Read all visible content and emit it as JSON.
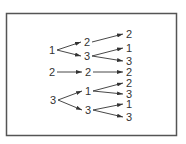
{
  "diagram": {
    "type": "tree",
    "color": "#333333",
    "nodes": [
      {
        "id": "a1",
        "label": "1",
        "x": 52,
        "y": 50
      },
      {
        "id": "a2",
        "label": "2",
        "x": 52,
        "y": 72
      },
      {
        "id": "a3",
        "label": "3",
        "x": 53,
        "y": 100
      },
      {
        "id": "b1",
        "label": "2",
        "x": 87,
        "y": 42
      },
      {
        "id": "b2",
        "label": "3",
        "x": 87,
        "y": 56
      },
      {
        "id": "b3",
        "label": "2",
        "x": 88,
        "y": 72
      },
      {
        "id": "b4",
        "label": "1",
        "x": 88,
        "y": 91
      },
      {
        "id": "b5",
        "label": "3",
        "x": 88,
        "y": 110
      },
      {
        "id": "c1",
        "label": "2",
        "x": 129,
        "y": 34
      },
      {
        "id": "c2",
        "label": "1",
        "x": 129,
        "y": 48
      },
      {
        "id": "c3",
        "label": "3",
        "x": 129,
        "y": 61
      },
      {
        "id": "c4",
        "label": "2",
        "x": 129,
        "y": 72
      },
      {
        "id": "c5",
        "label": "2",
        "x": 129,
        "y": 83
      },
      {
        "id": "c6",
        "label": "3",
        "x": 129,
        "y": 94
      },
      {
        "id": "c7",
        "label": "1",
        "x": 129,
        "y": 104
      },
      {
        "id": "c8",
        "label": "3",
        "x": 129,
        "y": 117
      }
    ],
    "edges": [
      [
        "a1",
        "b1"
      ],
      [
        "a1",
        "b2"
      ],
      [
        "a2",
        "b3"
      ],
      [
        "a3",
        "b4"
      ],
      [
        "a3",
        "b5"
      ],
      [
        "b1",
        "c1"
      ],
      [
        "b2",
        "c2"
      ],
      [
        "b2",
        "c3"
      ],
      [
        "b3",
        "c4"
      ],
      [
        "b4",
        "c5"
      ],
      [
        "b4",
        "c6"
      ],
      [
        "b5",
        "c7"
      ],
      [
        "b5",
        "c8"
      ]
    ]
  }
}
